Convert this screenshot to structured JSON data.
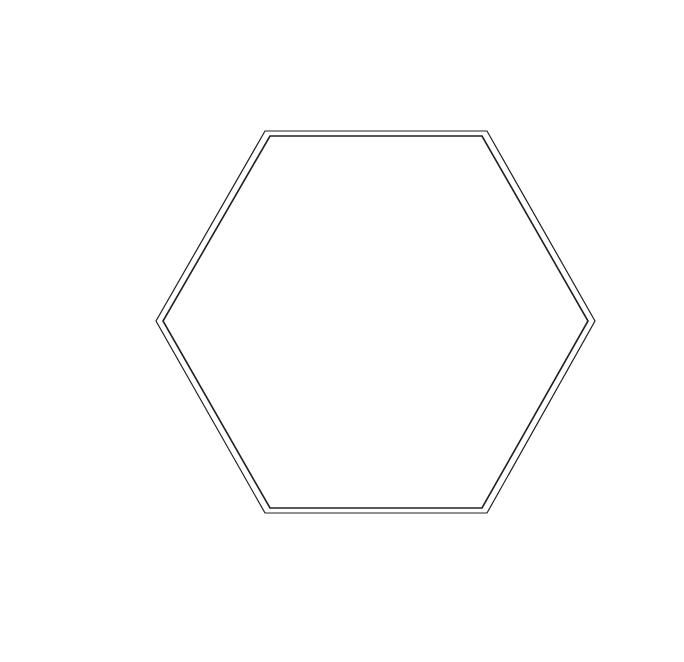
{
  "puzzle": {
    "number": "157",
    "caption_line1": "(15+15)x(15+15)",
    "caption_line2": "yolinde",
    "caption_line3": "105",
    "colors": {
      "ink": "#111111",
      "grid_thin": "#9a9a9a",
      "grid_thick": "#222222",
      "background": "#ffffff"
    }
  },
  "clues": {
    "top_left": [
      [
        "6"
      ],
      [
        "1",
        "2"
      ],
      [
        "1",
        "5",
        "2"
      ],
      [
        "1",
        "1",
        "6",
        "2"
      ],
      [
        "1",
        "1",
        "9",
        "4",
        "3",
        "2"
      ],
      [
        "2",
        "5",
        "8",
        "2"
      ],
      [
        "5",
        "3",
        "9",
        "2"
      ],
      [
        "1",
        "4",
        "10",
        "2"
      ],
      [
        "4",
        "10",
        "11",
        "2"
      ],
      [
        "10",
        "9",
        "3",
        "16",
        "2"
      ]
    ],
    "top_right": [
      [
        "10",
        "11",
        "8",
        "3"
      ],
      [
        "2",
        "11",
        "8",
        "4"
      ],
      [
        "2",
        "8",
        "3",
        "5",
        "4"
      ],
      [
        "2",
        "5",
        "11",
        "2",
        "6",
        "4"
      ],
      [
        "2",
        "4",
        "11",
        "6",
        "3"
      ],
      [
        "2",
        "8",
        "4",
        "16",
        "2"
      ],
      [
        "1",
        "6",
        "3",
        "2"
      ]
    ],
    "right_upper": [
      [
        "2",
        "4",
        "23",
        "5",
        "1"
      ],
      [
        "2",
        "7",
        "11",
        "3",
        "1"
      ],
      [
        "2",
        "8",
        "1",
        "1",
        "7"
      ],
      [
        "2",
        "17",
        "3",
        "1",
        "1"
      ],
      [
        "2",
        "15",
        "1",
        "2",
        "2"
      ],
      [
        "2",
        "12",
        "2",
        "1"
      ],
      [
        "2",
        "12",
        "2"
      ],
      [
        "2",
        "14",
        "2"
      ],
      [
        "4",
        "19",
        "3",
        "1"
      ],
      [
        "4",
        "13",
        "8"
      ],
      [
        "3",
        "1",
        "2"
      ],
      [
        "1",
        "13",
        "4"
      ],
      [
        "5",
        "7"
      ],
      [
        "10",
        "8"
      ],
      [
        "12"
      ]
    ],
    "right_lower": [
      [
        "6"
      ],
      [
        "3"
      ],
      [
        "4",
        "1"
      ],
      [
        "2",
        "1",
        "4"
      ],
      [
        "3",
        "2",
        "4"
      ],
      [
        "2"
      ],
      [
        "1",
        "3"
      ],
      [
        "2",
        "3",
        "2"
      ],
      [
        "2",
        "1",
        "2",
        "1"
      ],
      [
        "4",
        "5",
        "1",
        "2",
        "3"
      ],
      [
        "4",
        "1",
        "4",
        "4",
        "4"
      ],
      [
        "4",
        "1",
        "2"
      ],
      [
        "1",
        "1",
        "7",
        "3"
      ],
      [
        "2",
        "4",
        "2",
        "4",
        "1"
      ],
      [
        "1",
        "7",
        "4",
        "5",
        "3"
      ],
      [
        "6",
        "8",
        "3",
        "2",
        "2"
      ],
      [
        "20",
        "6",
        "9",
        "4",
        "8"
      ],
      [
        "5",
        "1",
        "4",
        "8",
        "3"
      ],
      [
        "10",
        "4"
      ],
      [
        "5"
      ]
    ],
    "left": [
      [
        "3",
        "1",
        "1"
      ],
      [
        "1",
        "1",
        "1",
        "2"
      ],
      [
        "3",
        "3",
        "1",
        "2"
      ],
      [
        "3",
        "1",
        "2"
      ],
      [
        "2"
      ],
      [
        "2",
        "5"
      ],
      [
        "2",
        "4"
      ],
      [
        "2",
        "1",
        "4",
        "1",
        "1"
      ],
      [
        "2",
        "2",
        "4",
        "2",
        "2",
        "1"
      ],
      [
        "8",
        "3",
        "2",
        "2",
        "2",
        "2"
      ],
      [
        "5",
        "2",
        "3",
        "2",
        "2",
        "2",
        "1"
      ],
      [
        "1",
        "3",
        "1",
        "2",
        "4",
        "2",
        "2",
        "3",
        "1"
      ],
      [
        "2",
        "3",
        "2",
        "2",
        "4",
        "2",
        "3",
        "2",
        "2"
      ],
      [
        "2",
        "3",
        "2",
        "5",
        "3",
        "5",
        "3",
        "3"
      ],
      [
        "2",
        "1",
        "4",
        "10",
        "10",
        "3"
      ],
      [
        "2",
        "2",
        "6",
        "9",
        "4",
        "3",
        "2",
        "2"
      ],
      [
        "2",
        "13",
        "5",
        "4",
        "4",
        "2",
        "1",
        "2",
        "2"
      ],
      [
        "2",
        "11",
        "14",
        "2",
        "2",
        "2",
        "1"
      ],
      [
        "2",
        "10",
        "14",
        "2",
        "3"
      ],
      [
        "2",
        "10",
        "13",
        "5",
        "4"
      ],
      [
        "2",
        "35",
        "4"
      ],
      [
        "2",
        "7",
        "25"
      ],
      [
        "2",
        "10",
        "19"
      ],
      [
        "4",
        "29",
        "2"
      ],
      [
        "4",
        "4",
        "21",
        "4"
      ],
      [
        "4",
        "21",
        "4"
      ],
      [
        "4",
        "7",
        "6"
      ],
      [
        "5",
        "5",
        "7"
      ],
      [
        "19",
        "5"
      ]
    ],
    "bottom": [
      [
        "29"
      ],
      [
        "2",
        "10"
      ],
      [
        "2",
        "15",
        "1",
        "1"
      ],
      [
        "18",
        "2"
      ],
      [
        "25",
        "2"
      ],
      [
        "20"
      ],
      [
        "5",
        "4",
        "4",
        "2"
      ],
      [
        "2",
        "12",
        "10",
        "2"
      ],
      [
        "3",
        "1",
        "3",
        "2"
      ],
      [
        "3",
        "2",
        "1",
        "2",
        "10",
        "2"
      ],
      [
        "2",
        "7",
        "10",
        "6",
        "3",
        "3"
      ],
      [
        "3",
        "2",
        "4",
        "24",
        "3",
        "7",
        "2"
      ],
      [
        "2",
        "4",
        "25",
        "4",
        "4"
      ],
      [
        "8",
        "2",
        "10",
        "18"
      ],
      [
        "6",
        "19",
        "4"
      ],
      [
        "20",
        "5"
      ]
    ]
  }
}
